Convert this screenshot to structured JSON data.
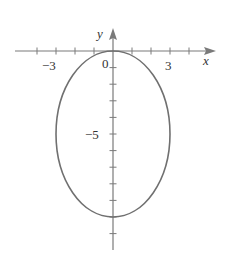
{
  "chart_data": {
    "type": "line",
    "title": "",
    "xlabel": "x",
    "ylabel": "y",
    "series": [
      {
        "name": "ellipse",
        "equation": "x^2/9 + (y+5)^2/25 = 1",
        "center": [
          0,
          -5
        ],
        "semi_axis_x": 3,
        "semi_axis_y": 5,
        "points": [
          [
            0,
            0
          ],
          [
            3,
            -5
          ],
          [
            0,
            -10
          ],
          [
            -3,
            -5
          ]
        ]
      }
    ],
    "x_ticks": [
      -4,
      -3,
      -2,
      -1,
      1,
      2,
      3,
      4
    ],
    "y_ticks": [
      -1,
      -2,
      -3,
      -4,
      -5,
      -6,
      -7,
      -8,
      -9,
      -10,
      -11
    ],
    "tick_labels": {
      "x": [
        "-3",
        "3"
      ],
      "y": [
        "-5"
      ],
      "origin": "0"
    },
    "xlim": [
      -5.2,
      5.4
    ],
    "ylim": [
      -12,
      1.3
    ],
    "grid": false,
    "legend": null
  },
  "labels": {
    "x_axis": "x",
    "y_axis": "y",
    "origin": "0",
    "x_neg3": "−3",
    "x_pos3": "3",
    "y_neg5": "−5"
  }
}
